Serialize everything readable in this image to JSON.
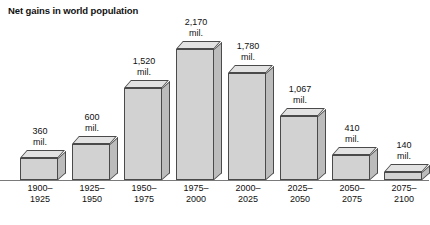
{
  "chart_data": {
    "type": "bar",
    "title": "Net gains in world population",
    "xlabel": "",
    "ylabel": "",
    "unit": "mil.",
    "grid": false,
    "legend": "none",
    "ylim": [
      0,
      2170
    ],
    "categories": [
      "1900–1925",
      "1925–1950",
      "1950–1975",
      "1975–2000",
      "2000–2025",
      "2025–2050",
      "2050–2075",
      "2075–2100"
    ],
    "category_lines": [
      [
        "1900–",
        "1925"
      ],
      [
        "1925–",
        "1950"
      ],
      [
        "1950–",
        "1975"
      ],
      [
        "1975–",
        "2000"
      ],
      [
        "2000–",
        "2025"
      ],
      [
        "2025–",
        "2050"
      ],
      [
        "2050–",
        "2075"
      ],
      [
        "2075–",
        "2100"
      ]
    ],
    "values": [
      360,
      600,
      1520,
      2170,
      1780,
      1067,
      410,
      140
    ],
    "value_labels": [
      "360",
      "600",
      "1,520",
      "2,170",
      "1,780",
      "1,067",
      "410",
      "140"
    ],
    "value_units": [
      "mil.",
      "mil.",
      "mil.",
      "mil.",
      "mil.",
      "mil.",
      "mil.",
      "mil."
    ]
  },
  "colors": {
    "bar_front": "#d2d2d2",
    "bar_top": "#e2e2e2",
    "bar_side": "#bcbcbc",
    "bar_outline": "#4a4a4a",
    "baseline": "#7a7a7a",
    "text": "#111111",
    "background": "#ffffff"
  }
}
